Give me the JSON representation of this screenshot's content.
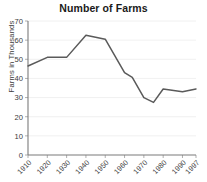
{
  "chart_data": {
    "type": "line",
    "title": "Number of Farms",
    "xlabel": "",
    "ylabel": "Farms in Thousands",
    "ylim": [
      0,
      70
    ],
    "ytick_labels": [
      "0",
      "10",
      "20",
      "30",
      "40",
      "50",
      "60",
      "70"
    ],
    "yticks": [
      0,
      10,
      20,
      30,
      40,
      50,
      60,
      70
    ],
    "xlim": [
      1910,
      1997
    ],
    "xtick_labels": [
      "1910",
      "1920",
      "1930",
      "1940",
      "1950",
      "1960",
      "1970",
      "1980",
      "1990",
      "1997"
    ],
    "xticks": [
      1910,
      1920,
      1930,
      1940,
      1950,
      1960,
      1970,
      1980,
      1990,
      1997
    ],
    "grid": true,
    "legend": false,
    "x": [
      1910,
      1920,
      1930,
      1940,
      1945,
      1950,
      1960,
      1964,
      1970,
      1975,
      1980,
      1990,
      1997
    ],
    "values": [
      46.5,
      51,
      51,
      62.5,
      61.5,
      60.5,
      43,
      40.5,
      30,
      27.5,
      34.5,
      33,
      34.5
    ],
    "series": [
      {
        "name": "Number of Farms",
        "values": [
          46.5,
          51,
          51,
          62.5,
          61.5,
          60.5,
          43,
          40.5,
          30,
          27.5,
          34.5,
          33,
          34.5
        ],
        "color": "#5a5a5a"
      }
    ]
  },
  "colors": {
    "line": "#5a5a5a",
    "grid": "#ececec",
    "axis": "#7b7b7b",
    "text": "#3b3b3b",
    "title": "#1a1a1a",
    "background": "#ffffff"
  }
}
